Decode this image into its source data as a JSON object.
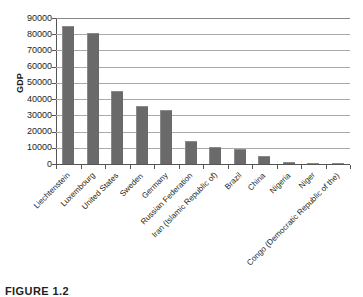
{
  "figure": {
    "caption": "FIGURE 1.2"
  },
  "chart_data": {
    "type": "bar",
    "title": "",
    "xlabel": "",
    "ylabel": "GDP",
    "ylim": [
      0,
      90000
    ],
    "yticks": [
      0,
      10000,
      20000,
      30000,
      40000,
      50000,
      60000,
      70000,
      80000,
      90000
    ],
    "ytick_labels": [
      "0",
      "10000",
      "20000",
      "30000",
      "40000",
      "50000",
      "60000",
      "70000",
      "80000",
      "90000"
    ],
    "grid": true,
    "legend": null,
    "bar_color": "#6a6a6a",
    "categories": [
      "Liechtenstein",
      "Luxembourg",
      "United States",
      "Sweden",
      "Germany",
      "Russian Federation",
      "Iran (Islamic Republic of)",
      "Brazil",
      "China",
      "Nigeria",
      "Niger",
      "Congo (Democratic Republic of the)"
    ],
    "values": [
      85000,
      81000,
      45000,
      36000,
      33500,
      14000,
      10500,
      9300,
      5000,
      1500,
      300,
      200
    ]
  }
}
